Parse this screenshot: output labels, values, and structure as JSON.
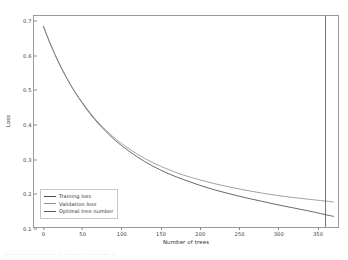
{
  "chart_data": {
    "type": "line",
    "title": "",
    "xlabel": "Number of trees",
    "ylabel": "Loss",
    "xlim": [
      -12,
      378
    ],
    "ylim": [
      0.1,
      0.715
    ],
    "grid": false,
    "legend_position": "lower left",
    "xticks": [
      0,
      50,
      100,
      150,
      200,
      250,
      300,
      350
    ],
    "yticks": [
      0.1,
      0.2,
      0.3,
      0.4,
      0.5,
      0.6,
      0.7
    ],
    "xtick_labels": [
      "0",
      "50",
      "100",
      "150",
      "200",
      "250",
      "300",
      "350"
    ],
    "ytick_labels": [
      "0.1",
      "0.2",
      "0.3",
      "0.4",
      "0.5",
      "0.6",
      "0.7"
    ],
    "series": [
      {
        "name": "Training loss",
        "color": "#4c4c4c",
        "x": [
          0,
          10,
          20,
          30,
          40,
          50,
          60,
          70,
          80,
          90,
          100,
          120,
          140,
          160,
          180,
          200,
          220,
          240,
          260,
          280,
          300,
          320,
          340,
          360,
          372
        ],
        "values": [
          0.685,
          0.628,
          0.578,
          0.534,
          0.495,
          0.461,
          0.43,
          0.403,
          0.379,
          0.357,
          0.338,
          0.305,
          0.278,
          0.256,
          0.238,
          0.222,
          0.208,
          0.196,
          0.185,
          0.175,
          0.165,
          0.156,
          0.147,
          0.137,
          0.131
        ]
      },
      {
        "name": "Validation loss",
        "color": "#8f8f8f",
        "x": [
          0,
          10,
          20,
          30,
          40,
          50,
          60,
          70,
          80,
          90,
          100,
          120,
          140,
          160,
          180,
          200,
          220,
          240,
          260,
          280,
          300,
          320,
          340,
          360,
          372
        ],
        "values": [
          0.685,
          0.628,
          0.578,
          0.534,
          0.496,
          0.463,
          0.433,
          0.406,
          0.383,
          0.362,
          0.344,
          0.313,
          0.288,
          0.268,
          0.251,
          0.238,
          0.226,
          0.216,
          0.207,
          0.199,
          0.192,
          0.186,
          0.181,
          0.176,
          0.173
        ]
      }
    ],
    "vertical_line": {
      "name": "Optimal tree number",
      "color": "#5a5a5a",
      "x": 362
    }
  },
  "legend": {
    "entries": [
      {
        "label": "Training loss"
      },
      {
        "label": "Validation loss"
      },
      {
        "label": "Optimal tree number"
      }
    ]
  },
  "caption": {
    "text": "···· ·· ····· ······ ··· ·· ··· ··· ···· ····· ·· ··· ····· ···· ··"
  }
}
